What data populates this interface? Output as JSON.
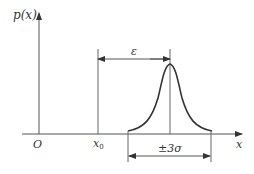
{
  "diagram": {
    "labels": {
      "y_axis": "p(x)",
      "x_axis": "x",
      "origin": "O",
      "x0_base": "x",
      "x0_sub": "0",
      "epsilon": "ε",
      "spread": "±3σ"
    },
    "colors": {
      "axis": "#555555",
      "curve": "#333333",
      "text": "#333333"
    }
  }
}
